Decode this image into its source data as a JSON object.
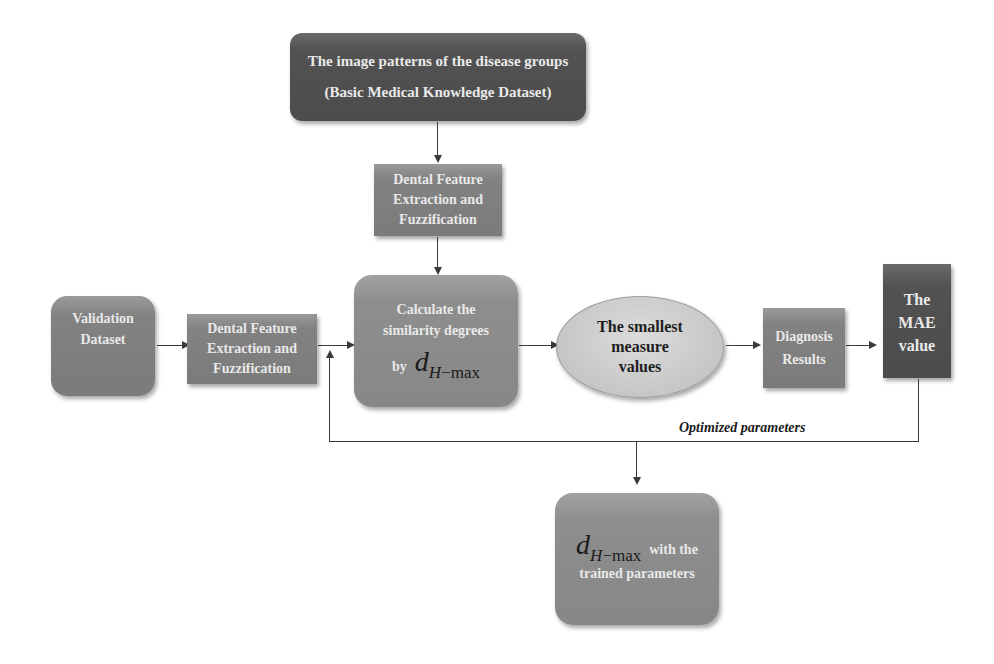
{
  "diagram": {
    "type": "flowchart",
    "colors": {
      "dark_node": "#525252",
      "mid_node": "#828282",
      "ellipse_node": "#c6c6c6",
      "connector": "#3a3a3a",
      "background": "#ffffff"
    },
    "nodes": {
      "top_dataset": {
        "line1": "The image patterns of the disease groups",
        "line2": "(Basic Medical Knowledge Dataset)"
      },
      "feature_extraction_top": {
        "line1": "Dental Feature",
        "line2": "Extraction and",
        "line3": "Fuzzification"
      },
      "validation_dataset": {
        "line1": "Validation",
        "line2": "Dataset"
      },
      "feature_extraction_left": {
        "line1": "Dental Feature",
        "line2": "Extraction and",
        "line3": "Fuzzification"
      },
      "similarity": {
        "line1": "Calculate the",
        "line2": "similarity degrees",
        "by": "by",
        "math_d": "d",
        "math_sub_h": "H",
        "math_sub_rest": "−max"
      },
      "smallest_values": {
        "line1": "The smallest",
        "line2": "measure",
        "line3": "values"
      },
      "diagnosis_results": {
        "line1": "Diagnosis",
        "line2": "Results"
      },
      "mae_value": {
        "line1": "The",
        "line2": "MAE",
        "line3": "value"
      },
      "trained_output": {
        "math_d": "d",
        "math_sub_h": "H",
        "math_sub_rest": "−max",
        "line1_rest": "with the",
        "line2": "trained parameters"
      }
    },
    "edge_labels": {
      "feedback": "Optimized parameters"
    },
    "edges": [
      {
        "from": "top_dataset",
        "to": "feature_extraction_top"
      },
      {
        "from": "feature_extraction_top",
        "to": "similarity"
      },
      {
        "from": "validation_dataset",
        "to": "feature_extraction_left"
      },
      {
        "from": "feature_extraction_left",
        "to": "similarity"
      },
      {
        "from": "similarity",
        "to": "smallest_values"
      },
      {
        "from": "smallest_values",
        "to": "diagnosis_results"
      },
      {
        "from": "diagnosis_results",
        "to": "mae_value"
      },
      {
        "from": "mae_value",
        "to": "similarity",
        "label": "Optimized parameters"
      },
      {
        "from": "mae_value",
        "to": "trained_output"
      }
    ]
  }
}
